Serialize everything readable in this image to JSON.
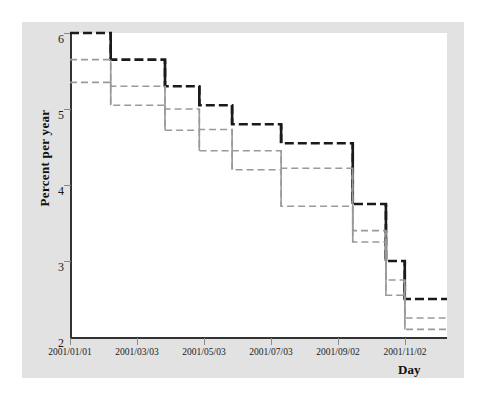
{
  "chart_data": {
    "type": "line",
    "subtype": "step",
    "title": "",
    "xlabel": "Day",
    "ylabel": "Percent per year",
    "xlim": [
      "2001/01/01",
      "2001/12/31"
    ],
    "ylim": [
      2,
      6
    ],
    "yticks": [
      6,
      5,
      4,
      3,
      2
    ],
    "xticks": [
      "2001/01/01",
      "2001/03/03",
      "2001/05/03",
      "2001/07/03",
      "2001/09/02",
      "2001/11/02"
    ],
    "grid": false,
    "legend": "none",
    "x": [
      "2001/01/01",
      "2001/02/01",
      "2001/03/21",
      "2001/04/19",
      "2001/05/16",
      "2001/06/28",
      "2001/08/22",
      "2001/09/18",
      "2001/10/03",
      "2001/11/07",
      "2001/12/12"
    ],
    "series": [
      {
        "name": "upper-step",
        "color": "#1a1a1a",
        "style": "dashed",
        "values": [
          6.0,
          5.65,
          5.3,
          5.05,
          4.8,
          4.55,
          3.75,
          3.0,
          2.5,
          2.5,
          2.5
        ]
      },
      {
        "name": "middle-step",
        "color": "#9a9a9a",
        "style": "dashed",
        "values": [
          5.65,
          5.3,
          5.0,
          4.73,
          4.45,
          4.22,
          3.4,
          2.75,
          2.25,
          2.25,
          2.25
        ]
      },
      {
        "name": "lower-step",
        "color": "#9a9a9a",
        "style": "dashed",
        "values": [
          5.35,
          5.05,
          4.72,
          4.45,
          4.2,
          3.72,
          3.25,
          2.55,
          2.1,
          2.1,
          2.1
        ]
      }
    ],
    "step_segments": {
      "upper": [
        {
          "x0": "2001/01/01",
          "x1": "2001/02/01",
          "y": 6.0
        },
        {
          "x0": "2001/02/01",
          "x1": "2001/03/21",
          "y": 5.65
        },
        {
          "x0": "2001/03/21",
          "x1": "2001/04/19",
          "y": 5.3
        },
        {
          "x0": "2001/04/19",
          "x1": "2001/05/16",
          "y": 5.05
        },
        {
          "x0": "2001/05/16",
          "x1": "2001/06/28",
          "y": 4.8
        },
        {
          "x0": "2001/06/28",
          "x1": "2001/08/22",
          "y": 4.55
        },
        {
          "x0": "2001/08/22",
          "x1": "2001/10/03",
          "y": 3.75
        },
        {
          "x0": "2001/10/03",
          "x1": "2001/11/07",
          "y": 3.0
        },
        {
          "x0": "2001/11/07",
          "x1": "2001/12/31",
          "y": 2.5
        }
      ]
    }
  },
  "axes": {
    "yticks": [
      {
        "label": "6",
        "value": 6
      },
      {
        "label": "5",
        "value": 5
      },
      {
        "label": "4",
        "value": 4
      },
      {
        "label": "3",
        "value": 3
      },
      {
        "label": "2",
        "value": 2
      }
    ],
    "xticks": [
      {
        "label": "2001/01/01"
      },
      {
        "label": "2001/03/03"
      },
      {
        "label": "2001/05/03"
      },
      {
        "label": "2001/07/03"
      },
      {
        "label": "2001/09/02"
      },
      {
        "label": "2001/11/02"
      }
    ],
    "ylabel": "Percent per year",
    "xlabel": "Day"
  },
  "colors": {
    "panel": "#e2e2e2",
    "plot": "#ffffff",
    "axis": "#333333",
    "series_dark": "#1a1a1a",
    "series_light": "#9a9a9a"
  }
}
